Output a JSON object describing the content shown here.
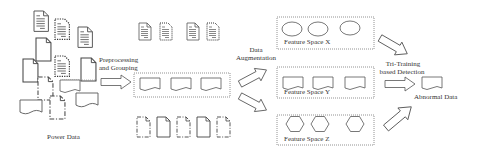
{
  "diagram": {
    "stages": {
      "input": {
        "label": "Power Data"
      },
      "preprocess": {
        "label_line1": "Preprocessing",
        "label_line2": "and Grouping"
      },
      "augment": {
        "label_line1": "Data",
        "label_line2": "Augmentation"
      },
      "feature_spaces": [
        {
          "label": "Feature Space X",
          "shape": "ellipse",
          "count": 3
        },
        {
          "label": "Feature Space Y",
          "shape": "wavy-document",
          "count": 3
        },
        {
          "label": "Feature Space Z",
          "shape": "hexagon",
          "count": 3
        }
      ],
      "detection": {
        "label_line1": "Tri-Training",
        "label_line2": "based Detection"
      },
      "output": {
        "label": "Abnormal Data"
      }
    },
    "groups": {
      "text_documents": {
        "count": 4,
        "style": "alternating solid/dotted"
      },
      "wavy_documents": {
        "count": 3,
        "style": "dotted box"
      },
      "blank_documents": {
        "count": 5,
        "style": "alternating solid/dash-dot"
      }
    },
    "colors": {
      "stroke": "#555555",
      "text": "#333333",
      "background": "#ffffff"
    }
  }
}
